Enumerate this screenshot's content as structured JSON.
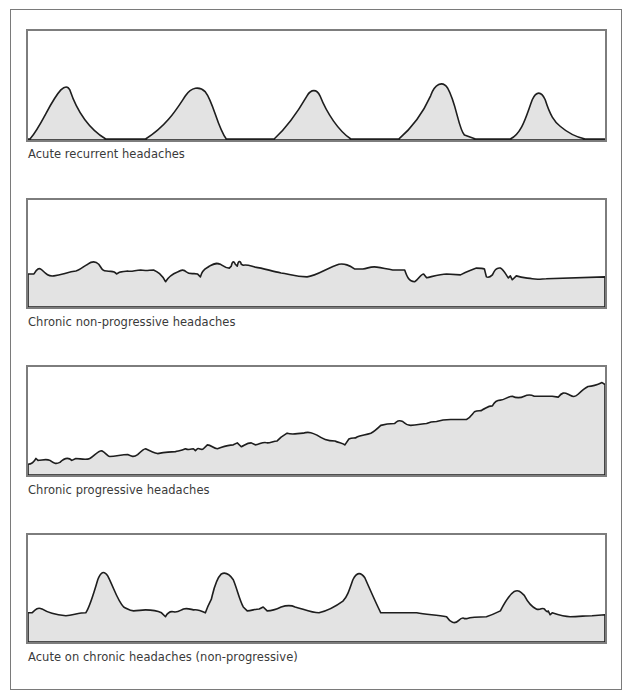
{
  "figure": {
    "colors": {
      "fill": "#e3e3e3",
      "line": "#1e1e1e",
      "border": "#7d7d7d",
      "text": "#3a3a3a"
    },
    "panels": [
      {
        "label": "Acute recurrent headaches",
        "pattern": "acute-recurrent",
        "path": "M0,110 L2,110 C14,96 22,72 33,60 C37,56 40,56 42,60 C50,84 62,100 78,110 L118,110 C140,96 150,78 158,66 C164,57 172,56 178,62 C186,72 190,98 199,110 L247,110 C262,96 272,80 280,66 C284,59 290,59 293,66 C300,84 312,102 324,110 L372,110 C386,98 396,84 404,66 C408,54 416,50 421,58 C430,74 432,100 438,106 L449,110 L484,110 C496,104 500,86 506,70 C510,61 515,61 519,70 C524,86 528,92 534,97 C542,104 550,108 559,110 L579,110"
      },
      {
        "label": "Chronic non-progressive headaches",
        "pattern": "chronic-non-progressive",
        "path": "M0,76 L6,76 C9,71 11,69 14,72 C18,76 21,79 26,78 C34,77 40,74 48,73 C52,72 56,68 60,66 C64,63 68,63 71,66 C74,70 74,73 79,73 C84,74 86,72 89,76 C92,73 96,74 100,73 C104,74 108,72 113,72 C118,73 122,72 126,72 C130,74 134,76 138,84 C141,79 145,76 150,74 C154,72 156,71 159,74 C162,77 166,75 170,76 L173,79 C175,70 180,70 182,68 C186,66 188,64 193,66 C196,68 198,70 202,70 L204,68 C205,62 207,63 208,66 L210,68 C211,62 213,62 214,66 L216,67 C220,66 224,68 228,69 C236,70 244,73 254,75 C262,76 268,79 280,79 C290,78 300,70 312,66 C318,65 322,67 328,71 L336,71 C342,70 344,68 350,69 C356,70 360,71 366,72 L374,72 L378,72 C380,78 382,84 388,84 C392,82 394,76 397,76 L400,80 C408,78 414,76 420,76 L434,77 C440,74 444,72 450,70 C454,70 456,70 458,71 L460,79 C462,80 464,79 466,77 C468,72 470,69 474,70 C478,72 480,78 482,80 L484,78 L486,82 L490,78 C496,80 500,80 506,81 C512,82 516,81 520,81 L579,79 L579,110 L0,110 Z"
      },
      {
        "label": "Chronic progressive headaches",
        "pattern": "chronic-progressive",
        "path": "M0,100 C4,100 6,98 8,94 L10,96 C14,96 18,94 22,96 C26,99 28,100 32,98 C36,94 40,92 44,96 L48,94 C52,94 58,96 62,94 C66,92 70,86 74,86 C78,88 80,92 82,92 C88,92 94,90 100,90 C104,92 106,93 110,90 C114,86 116,84 118,84 C122,86 126,88 130,89 C136,88 142,87 148,87 C152,86 154,86 158,84 C162,86 164,84 166,84 L168,86 L170,84 C172,83 174,86 176,84 L180,80 C184,80 186,84 190,84 C196,82 200,80 206,80 L210,78 L214,82 C218,80 220,78 224,78 L228,80 C232,80 236,76 240,78 C244,78 246,76 250,76 L254,72 L260,68 C266,70 270,68 276,68 C282,66 286,68 290,70 C296,74 300,76 308,76 C312,78 316,78 318,80 L322,74 C326,72 328,74 330,72 C334,70 338,70 344,68 C348,66 350,64 354,60 C360,58 364,58 368,58 C370,56 372,54 376,56 C378,58 380,60 384,60 C390,60 396,58 400,58 C404,56 406,56 410,56 C416,54 418,54 424,54 C430,54 434,54 440,54 C444,52 446,48 448,46 C452,44 454,46 456,44 C460,42 462,40 466,40 C468,36 470,34 474,34 C478,34 482,30 486,30 C490,32 494,32 498,30 C502,28 504,28 508,30 C514,30 520,30 526,30 L532,31 C536,26 538,26 542,28 C546,30 548,32 552,28 C556,24 558,22 562,20 C568,20 572,18 576,16 L579,18 L579,111 L0,111 Z"
      },
      {
        "label": "Acute on chronic headaches (non-progressive)",
        "pattern": "acute-on-chronic",
        "path": "M0,80 L4,80 C8,76 10,74 14,76 C20,80 28,82 38,83 C46,82 52,80 58,80 C62,74 66,60 70,46 C73,38 76,36 80,42 C86,54 90,68 96,74 C100,76 102,78 106,78 C110,78 114,77 118,77 C124,77 130,78 134,80 L138,84 C140,80 142,78 146,79 C150,80 152,78 156,76 C160,75 162,76 166,77 C170,76 174,78 178,80 C180,74 182,70 184,66 C186,58 188,46 194,40 C198,38 202,40 206,46 C210,56 212,66 216,74 L220,78 C224,78 228,76 232,76 L236,74 L240,78 C244,78 250,76 254,74 C260,72 264,72 268,74 C276,76 284,80 292,80 C300,78 308,74 316,68 C320,64 322,58 326,46 C330,38 334,38 338,44 C344,58 350,72 354,80 L390,80 C400,82 410,82 420,84 C424,90 428,92 432,88 C434,86 436,84 438,86 L440,86 C446,84 452,84 460,84 C466,82 470,80 474,78 C478,70 482,62 488,58 C492,56 494,58 498,62 C502,70 506,74 510,76 C514,78 516,74 518,76 C520,78 521,80 522,78 L524,82 L526,80 C532,82 538,84 544,84 C552,84 560,83 566,83 L579,82 L579,110 L0,110 Z"
      }
    ]
  }
}
